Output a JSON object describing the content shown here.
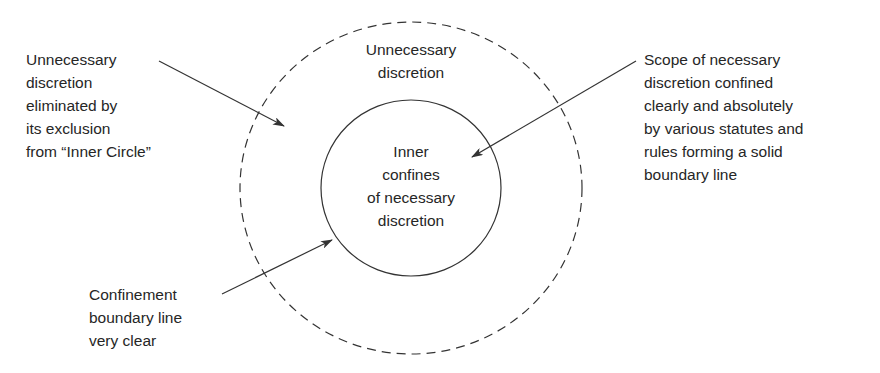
{
  "diagram": {
    "outer_circle": {
      "label": "Unnecessary\ndiscretion",
      "style": "dashed"
    },
    "inner_circle": {
      "label": "Inner\nconfines\nof necessary\ndiscretion",
      "style": "solid"
    },
    "callouts": [
      {
        "id": "top-left",
        "text": "Unnecessary\ndiscretion\neliminated by\nits exclusion\nfrom “Inner Circle”"
      },
      {
        "id": "top-right",
        "text": "Scope of necessary\ndiscretion confined\nclearly and absolutely\nby various statutes and\nrules forming a solid\nboundary line"
      },
      {
        "id": "bottom-left",
        "text": "Confinement\nboundary line\nvery clear"
      }
    ],
    "colors": {
      "line": "#333333",
      "text": "#262626",
      "background": "#ffffff"
    }
  }
}
